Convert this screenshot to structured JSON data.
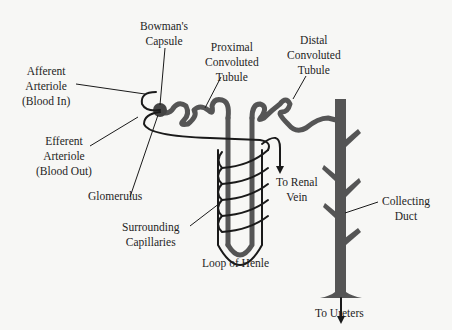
{
  "diagram": {
    "colors": {
      "tubule": "#555555",
      "vessel": "#1a1a1a",
      "text": "#1e1e1e",
      "background": "#f7f7f5"
    },
    "labels": {
      "bowmans_capsule": [
        "Bowman's",
        "Capsule"
      ],
      "afferent_arteriole": [
        "Afferent",
        "Arteriole",
        "(Blood In)"
      ],
      "efferent_arteriole": [
        "Efferent",
        "Arteriole",
        "(Blood Out)"
      ],
      "glomerulus": [
        "Glomerulus"
      ],
      "proximal_convoluted_tubule": [
        "Proximal",
        "Convoluted",
        "Tubule"
      ],
      "distal_convoluted_tubule": [
        "Distal",
        "Convoluted",
        "Tubule"
      ],
      "surrounding_capillaries": [
        "Surrounding",
        "Capillaries"
      ],
      "loop_of_henle": [
        "Loop of Henle"
      ],
      "to_renal_vein": [
        "To Renal",
        "Vein"
      ],
      "collecting_duct": [
        "Collecting",
        "Duct"
      ],
      "to_ureters": [
        "To Ureters"
      ]
    }
  }
}
